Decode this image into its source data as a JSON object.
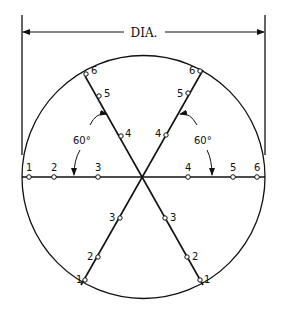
{
  "diagram": {
    "title_label": "DIA.",
    "angle_left": "60°",
    "angle_right": "60°",
    "horizontal_points": [
      "1",
      "2",
      "3",
      "4",
      "5",
      "6"
    ],
    "diag_left_top_points": [
      "6",
      "5",
      "4"
    ],
    "diag_right_top_points": [
      "6",
      "5",
      "4"
    ],
    "diag_left_bottom_points": [
      "3",
      "2",
      "1"
    ],
    "diag_right_bottom_points": [
      "3",
      "2",
      "1"
    ],
    "colors": {
      "stroke": "#111111",
      "background": "#ffffff"
    }
  }
}
